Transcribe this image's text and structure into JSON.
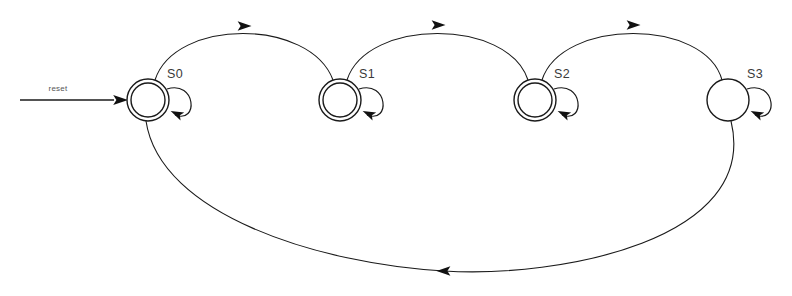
{
  "diagram": {
    "kind": "finite-state-machine",
    "title": "",
    "background_color": "#ffffff",
    "stroke_color": "#1a1a1a",
    "label_color": "#3a3a3a",
    "width": 792,
    "height": 296
  },
  "initial": {
    "label": "reset",
    "target_state": "S0",
    "arrow_from_x": 20,
    "arrow_to_x": 120,
    "arrow_y": 100,
    "label_x": 58,
    "label_y": 91
  },
  "states": [
    {
      "id": "S0",
      "label": "S0",
      "cx": 148,
      "cy": 100,
      "r_outer": 21,
      "r_inner": 17,
      "accepting": true,
      "initial": true,
      "label_x": 175,
      "label_y": 78,
      "self_loop": true
    },
    {
      "id": "S1",
      "label": "S1",
      "cx": 340,
      "cy": 100,
      "r_outer": 21,
      "r_inner": 17,
      "accepting": true,
      "initial": false,
      "label_x": 367,
      "label_y": 78,
      "self_loop": true
    },
    {
      "id": "S2",
      "label": "S2",
      "cx": 535,
      "cy": 100,
      "r_outer": 21,
      "r_inner": 17,
      "accepting": true,
      "initial": false,
      "label_x": 562,
      "label_y": 78,
      "self_loop": true
    },
    {
      "id": "S3",
      "label": "S3",
      "cx": 728,
      "cy": 100,
      "r_outer": 21,
      "r_inner": 0,
      "accepting": false,
      "initial": false,
      "label_x": 755,
      "label_y": 78,
      "self_loop": true
    }
  ],
  "transitions": [
    {
      "id": "t-s0-s1",
      "from": "S0",
      "to": "S1",
      "label": "",
      "kind": "arc-top",
      "direction": "right",
      "path": "M 155,80 C 175,18 310,18 333,80",
      "arrow_x": 244,
      "arrow_y": 26,
      "arrow_rotation": 0
    },
    {
      "id": "t-s1-s2",
      "from": "S1",
      "to": "S2",
      "label": "",
      "kind": "arc-top",
      "direction": "right",
      "path": "M 347,80 C 367,18 508,18 528,80",
      "arrow_x": 438,
      "arrow_y": 25,
      "arrow_rotation": 0
    },
    {
      "id": "t-s2-s3",
      "from": "S2",
      "to": "S3",
      "label": "",
      "kind": "arc-top",
      "direction": "right",
      "path": "M 542,80 C 562,18 705,18 722,80",
      "arrow_x": 633,
      "arrow_y": 25,
      "arrow_rotation": 0
    },
    {
      "id": "t-s3-s0",
      "from": "S3",
      "to": "S0",
      "label": "",
      "kind": "arc-bottom",
      "direction": "left",
      "path": "M 731,121 C 760,240 560,278 444,271 C 320,264 160,215 146,121",
      "arrow_x": 444,
      "arrow_y": 271,
      "arrow_rotation": 180
    }
  ],
  "self_loops": [
    {
      "id": "loop-s0",
      "state": "S0",
      "label": "",
      "path": "M 167,89 C 196,80 199,124 175,115",
      "arrow_x": 177,
      "arrow_y": 114,
      "arrow_rotation": 205
    },
    {
      "id": "loop-s1",
      "state": "S1",
      "label": "",
      "path": "M 359,89 C 388,80 391,124 367,115",
      "arrow_x": 369,
      "arrow_y": 114,
      "arrow_rotation": 205
    },
    {
      "id": "loop-s2",
      "state": "S2",
      "label": "",
      "path": "M 554,89 C 583,80 586,124 562,115",
      "arrow_x": 564,
      "arrow_y": 114,
      "arrow_rotation": 205
    },
    {
      "id": "loop-s3",
      "state": "S3",
      "label": "",
      "path": "M 747,89 C 776,80 779,124 755,115",
      "arrow_x": 757,
      "arrow_y": 114,
      "arrow_rotation": 205
    }
  ]
}
